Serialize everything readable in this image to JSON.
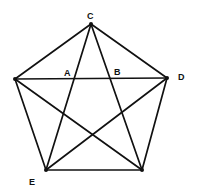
{
  "diagram": {
    "type": "complete-graph-pentagon",
    "vertices": [
      {
        "id": "C",
        "label": "C"
      },
      {
        "id": "L",
        "label": ""
      },
      {
        "id": "D",
        "label": "D"
      },
      {
        "id": "E",
        "label": "E"
      },
      {
        "id": "R",
        "label": ""
      }
    ],
    "intersection_labels": [
      {
        "id": "A",
        "label": "A"
      },
      {
        "id": "B",
        "label": "B"
      }
    ],
    "edges": [
      [
        "C",
        "L"
      ],
      [
        "C",
        "D"
      ],
      [
        "L",
        "E"
      ],
      [
        "E",
        "R"
      ],
      [
        "R",
        "D"
      ],
      [
        "L",
        "D"
      ],
      [
        "C",
        "E"
      ],
      [
        "C",
        "R"
      ],
      [
        "L",
        "R"
      ],
      [
        "E",
        "D"
      ]
    ],
    "colors": {
      "line": "#111111",
      "background": "#ffffff"
    }
  }
}
